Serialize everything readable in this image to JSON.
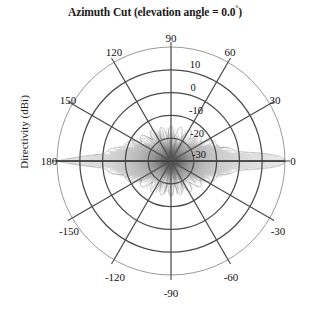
{
  "chart_data": {
    "type": "line",
    "subtype": "polar-antenna-pattern",
    "title": "Azimuth Cut (elevation angle = 0.0",
    "title_degree_symbol": "°",
    "title_suffix": ")",
    "elevation_angle_deg": "0.0",
    "ylabel": "Directivity (dBi)",
    "xlabel": "",
    "angular_unit": "degrees",
    "angular_tick_labels": [
      "0",
      "30",
      "60",
      "90",
      "120",
      "150",
      "180",
      "-150",
      "-120",
      "-90",
      "-60",
      "-30"
    ],
    "angular_tick_values": [
      0,
      30,
      60,
      90,
      120,
      150,
      180,
      -150,
      -120,
      -90,
      -60,
      -30
    ],
    "angular_tick_step": 30,
    "radial_tick_labels": [
      "10",
      "0",
      "-10",
      "-20",
      "-30"
    ],
    "radial_tick_values": [
      10,
      0,
      -10,
      -20,
      -30
    ],
    "rlim": [
      -40,
      10
    ],
    "r_center_value": -40,
    "r_outer_value": 10,
    "grid": true,
    "legend": false,
    "n_grid_circles": 5,
    "n_grid_spokes": 12,
    "peak_directivity_dbi": 10,
    "main_lobe_angles_deg": [
      0,
      180
    ],
    "series": [
      {
        "name": "Directivity",
        "color": "#555555",
        "description": "Azimuth directivity pattern with endfire main lobes at 0 and 180 degrees and dense sidelobe structure",
        "theta_deg": [
          0,
          1,
          2,
          3,
          4,
          5,
          6,
          7,
          8,
          9,
          10,
          12,
          14,
          16,
          18,
          20,
          25,
          30,
          35,
          40,
          45,
          50,
          55,
          60,
          65,
          70,
          75,
          80,
          85,
          90,
          95,
          100,
          105,
          110,
          115,
          120,
          125,
          130,
          135,
          140,
          145,
          150,
          155,
          160,
          162,
          164,
          166,
          168,
          170,
          172,
          174,
          176,
          178,
          180
        ],
        "r_dbi": [
          10.0,
          9.4,
          7.8,
          5.2,
          1.8,
          -2.0,
          -6.0,
          -9.5,
          -12.0,
          -13.5,
          -14.2,
          -15.0,
          -16.5,
          -18.0,
          -19.5,
          -20.5,
          -22.5,
          -24.0,
          -25.5,
          -26.5,
          -27.5,
          -28.0,
          -28.5,
          -29.0,
          -29.5,
          -30.0,
          -30.2,
          -30.5,
          -30.8,
          -31.0,
          -30.8,
          -30.5,
          -30.2,
          -30.0,
          -29.5,
          -29.0,
          -28.5,
          -28.0,
          -27.5,
          -26.5,
          -25.5,
          -24.0,
          -22.5,
          -20.5,
          -19.5,
          -18.0,
          -16.5,
          -15.0,
          -14.2,
          -13.5,
          -12.0,
          -6.0,
          1.8,
          10.0
        ]
      }
    ],
    "geometry": {
      "center_x": 171,
      "center_y": 161,
      "outer_radius": 114
    }
  },
  "angle_label_positions": [
    {
      "label": "90",
      "x": 171,
      "y": 38
    },
    {
      "label": "120",
      "x": 114,
      "y": 52
    },
    {
      "label": "60",
      "x": 230,
      "y": 52
    },
    {
      "label": "150",
      "x": 68,
      "y": 100
    },
    {
      "label": "30",
      "x": 275,
      "y": 100
    },
    {
      "label": "180",
      "x": 49,
      "y": 161
    },
    {
      "label": "0",
      "x": 293,
      "y": 161
    },
    {
      "label": "-150",
      "x": 69,
      "y": 231
    },
    {
      "label": "-30",
      "x": 278,
      "y": 231
    },
    {
      "label": "-120",
      "x": 115,
      "y": 277
    },
    {
      "label": "-60",
      "x": 231,
      "y": 277
    },
    {
      "label": "-90",
      "x": 171,
      "y": 293
    }
  ],
  "radial_label_positions": [
    {
      "label": "10",
      "x": 195,
      "y": 64
    },
    {
      "label": "0",
      "x": 193,
      "y": 87
    },
    {
      "label": "-10",
      "x": 196,
      "y": 110
    },
    {
      "label": "-20",
      "x": 197,
      "y": 133
    },
    {
      "label": "-30",
      "x": 199,
      "y": 154
    }
  ],
  "colors": {
    "grid_major": "#4a4a4a",
    "grid_outer": "#8e8e8e",
    "trace": "#555555",
    "text": "#111111",
    "background": "#ffffff"
  }
}
